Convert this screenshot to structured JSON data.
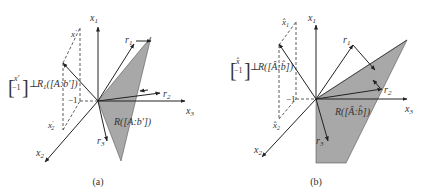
{
  "figure": {
    "panels": [
      {
        "id": "a",
        "caption": "(a)",
        "axes": {
          "x1": "x",
          "x1_sub": "1",
          "x2": "x",
          "x2_sub": "2",
          "x3": "x",
          "x3_sub": "3"
        },
        "vectors": {
          "r1": "r",
          "r1_sub": "1",
          "r2": "r",
          "r2_sub": "2",
          "r3": "r",
          "r3_sub": "3"
        },
        "point_labels": {
          "x1_comp": "x",
          "x1_comp_sup": "′",
          "x1_comp_sub": "1",
          "x2_comp": "x",
          "x2_comp_sup": "′",
          "x2_comp_sub": "2",
          "minus_one": "−1"
        },
        "perp_label": {
          "vec_top": "x′",
          "vec_bottom": "−1",
          "perp": "⊥",
          "rest": "R",
          "rest_sub": "1",
          "rest_arg": "([A:b′])"
        },
        "region_label": "R([A:b′])"
      },
      {
        "id": "b",
        "caption": "(b)",
        "axes": {
          "x1": "x",
          "x1_sub": "1",
          "x2": "x",
          "x2_sub": "2",
          "x3": "x",
          "x3_sub": "3"
        },
        "vectors": {
          "r1": "r",
          "r1_sub": "1",
          "r2": "r",
          "r2_sub": "2",
          "r3": "r",
          "r3_sub": "3"
        },
        "point_labels": {
          "x1_comp": "x̂",
          "x1_comp_sub": "1",
          "x2_comp": "x̂",
          "x2_comp_sub": "2",
          "minus_one": "−1"
        },
        "perp_label": {
          "vec_top": "x̂",
          "vec_bottom": "−1",
          "perp": "⊥",
          "rest": "R",
          "rest_arg": "([Â:b̂])"
        },
        "region_label": "R([Â:b̂])"
      }
    ],
    "colors": {
      "shade": "#a8a8a8",
      "ink": "#222222",
      "background": "#ffffff"
    }
  }
}
